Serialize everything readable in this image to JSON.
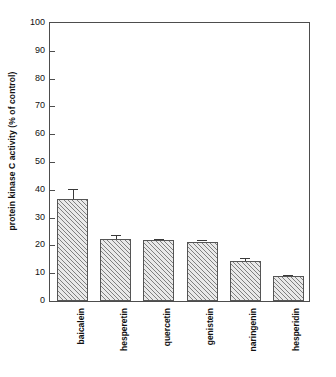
{
  "chart_data": {
    "type": "bar",
    "title": "",
    "subtitle": "",
    "xlabel": "",
    "ylabel": "protein kinase C activity (% of control)",
    "categories": [
      "baicalein",
      "hesperetin",
      "quercetin",
      "genistein",
      "naringenin",
      "hesperidin"
    ],
    "values": [
      36.8,
      22.3,
      22.0,
      21.4,
      14.5,
      8.9
    ],
    "errors": [
      3.4,
      1.3,
      0.4,
      0.7,
      1.0,
      0.5
    ],
    "ylim": [
      0,
      100
    ],
    "yticks": [
      0,
      10,
      20,
      30,
      40,
      50,
      60,
      70,
      80,
      90,
      100
    ],
    "ytick_labels": [
      "0",
      "10",
      "20",
      "30",
      "40",
      "50",
      "60",
      "70",
      "80",
      "90",
      "100"
    ],
    "grid": false,
    "legend": null,
    "bar_fill": "#e9e9e9",
    "bar_hatch": "diagonal-45",
    "bar_edge_color": "#555555",
    "axis_color": "#4d4d4d",
    "text_color": "#111111"
  }
}
